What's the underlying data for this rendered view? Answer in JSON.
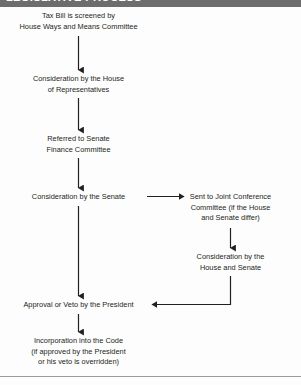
{
  "header": {
    "band_text": "LEGISLATIVE PROCESS",
    "band_color": "#6d6d6d"
  },
  "diagram": {
    "text_color": "#231f20",
    "line_color": "#231f20",
    "background": "#fdfdfd",
    "nodes": [
      {
        "id": "tax-bill-screened",
        "label": "Tax Bill is screened by\nHouse Ways and Means Committee",
        "column": "left"
      },
      {
        "id": "house-consideration",
        "label": "Consideration by the House\nof Representatives",
        "column": "left"
      },
      {
        "id": "senate-finance-referral",
        "label": "Referred to Senate\nFinance Committee",
        "column": "left"
      },
      {
        "id": "senate-consideration",
        "label": "Consideration by the Senate",
        "column": "left"
      },
      {
        "id": "joint-conference",
        "label": "Sent to Joint Conference\nCommittee (if the House\nand Senate differ)",
        "column": "right"
      },
      {
        "id": "house-senate-consideration",
        "label": "Consideration by the\nHouse and Senate",
        "column": "right"
      },
      {
        "id": "presidential-approval",
        "label": "Approval or Veto by the President",
        "column": "left"
      },
      {
        "id": "incorporation-into-code",
        "label": "Incorporation into the Code\n(if approved by the President\nor his veto is overridden)",
        "column": "left"
      }
    ],
    "edges": [
      {
        "from": "tax-bill-screened",
        "to": "house-consideration",
        "direction": "down"
      },
      {
        "from": "house-consideration",
        "to": "senate-finance-referral",
        "direction": "down"
      },
      {
        "from": "senate-finance-referral",
        "to": "senate-consideration",
        "direction": "down"
      },
      {
        "from": "senate-consideration",
        "to": "joint-conference",
        "direction": "right"
      },
      {
        "from": "senate-consideration",
        "to": "presidential-approval",
        "direction": "down"
      },
      {
        "from": "joint-conference",
        "to": "house-senate-consideration",
        "direction": "down"
      },
      {
        "from": "house-senate-consideration",
        "to": "presidential-approval",
        "direction": "elbow-left"
      },
      {
        "from": "presidential-approval",
        "to": "incorporation-into-code",
        "direction": "down"
      }
    ]
  }
}
